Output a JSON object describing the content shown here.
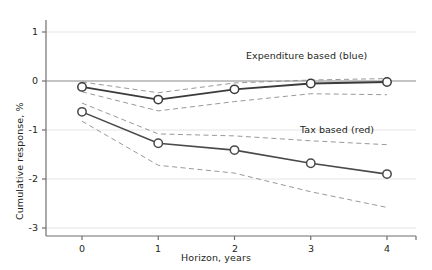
{
  "chart_data": {
    "type": "line",
    "title": "",
    "subtitle": "",
    "xlabel": "Horizon, years",
    "ylabel": "Cumulative response, %",
    "x": [
      0,
      1,
      2,
      3,
      4
    ],
    "xticklabels": [
      "0",
      "1",
      "2",
      "3",
      "4"
    ],
    "yticklabels": [
      "1",
      "0",
      "-1",
      "-2",
      "-3"
    ],
    "yticks": [
      1,
      0,
      -1,
      -2,
      -3
    ],
    "xlim": [
      -0.45,
      4.45
    ],
    "ylim": [
      -3,
      1.45
    ],
    "grid": "horizontal-light",
    "legend_position": "inline-annotation",
    "zero_line": 0,
    "series": [
      {
        "name": "Expenditure based (blue)",
        "annotation": "Expenditure based (blue)",
        "color": "#3b3b3b",
        "marker": "open-circle",
        "values": [
          -0.12,
          -0.38,
          -0.17,
          -0.05,
          -0.02
        ],
        "band_upper": [
          -0.02,
          -0.24,
          -0.04,
          0.02,
          0.05
        ],
        "band_lower": [
          -0.22,
          -0.61,
          -0.42,
          -0.26,
          -0.28
        ]
      },
      {
        "name": "Tax based (red)",
        "annotation": "Tax based (red)",
        "color": "#4a4a4a",
        "marker": "open-circle",
        "values": [
          -0.63,
          -1.27,
          -1.41,
          -1.68,
          -1.9
        ],
        "band_upper": [
          -0.45,
          -1.08,
          -1.12,
          -1.22,
          -1.3
        ],
        "band_lower": [
          -0.82,
          -1.72,
          -1.88,
          -2.26,
          -2.58
        ]
      }
    ],
    "annotations": [
      {
        "text": "Expenditure based (blue)",
        "x_px": 246,
        "y_px": 57
      },
      {
        "text": "Tax based (red)",
        "x_px": 300,
        "y_px": 131
      }
    ]
  }
}
